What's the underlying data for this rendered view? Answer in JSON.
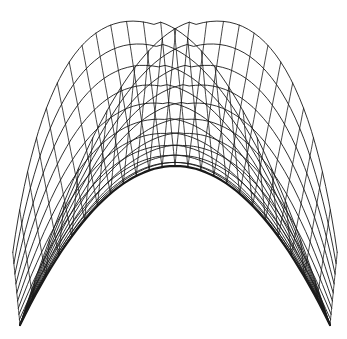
{
  "chart_data": {
    "type": "wireframe-surface",
    "title": "",
    "xlabel": "",
    "ylabel": "",
    "grid": false,
    "legend": null,
    "stroke_color": "#1a1a1a",
    "background": "#ffffff",
    "inner_apex": [
      175,
      166
    ],
    "left_tip": [
      22,
      325
    ],
    "right_tip": [
      332,
      325
    ],
    "lobe_peaks": [
      [
        135,
        15
      ],
      [
        218,
        15
      ]
    ],
    "rings": 10,
    "spokes": 24,
    "samples": 60
  }
}
